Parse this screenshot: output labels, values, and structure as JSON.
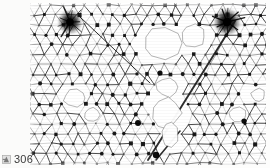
{
  "page": {
    "width": 270,
    "height": 168,
    "background_color": "#fdfdfc",
    "paper_color": "#ffffff"
  },
  "caption": {
    "page_number": "306",
    "glyph_name": "cropped-marginal-mark",
    "text_color": "#3a3a3a"
  },
  "figure": {
    "name": "triangular-lattice-micrograph",
    "panel": {
      "x": 30,
      "y": 3,
      "width": 236,
      "height": 162
    },
    "ink_color": "#111111",
    "mid_ink_color": "#555555",
    "faint_ink_color": "#9a9a9a",
    "void_color": "#ffffff"
  },
  "chart_data": {
    "type": "scatter",
    "title": "",
    "xlabel": "",
    "ylabel": "",
    "lattice": {
      "symmetry": "triangular",
      "spacing_x": 11.4,
      "spacing_y": 9.9,
      "row_offset": 5.7,
      "rows": 17,
      "cols": 22,
      "shear_per_row": 0.0,
      "jitter": 1.25,
      "seed": 20250306
    },
    "axis": {
      "xlim": [
        0,
        236
      ],
      "ylim": [
        0,
        162
      ],
      "grid": false,
      "legend": null
    },
    "voids": [
      {
        "name": "void-upper-center",
        "cx": 132,
        "cy": 40,
        "rx": 23,
        "ry": 19
      },
      {
        "name": "void-upper-right",
        "cx": 163,
        "cy": 34,
        "rx": 15,
        "ry": 13
      },
      {
        "name": "void-mid-center",
        "cx": 138,
        "cy": 84,
        "rx": 13,
        "ry": 11
      },
      {
        "name": "void-lower-center",
        "cx": 136,
        "cy": 110,
        "rx": 16,
        "ry": 16
      },
      {
        "name": "void-lower-center-2",
        "cx": 140,
        "cy": 132,
        "rx": 10,
        "ry": 13
      },
      {
        "name": "void-left-mid",
        "cx": 45,
        "cy": 95,
        "rx": 13,
        "ry": 10
      },
      {
        "name": "void-left-low",
        "cx": 62,
        "cy": 112,
        "rx": 9,
        "ry": 8
      },
      {
        "name": "void-right-low",
        "cx": 208,
        "cy": 112,
        "rx": 10,
        "ry": 9
      },
      {
        "name": "void-right-edge",
        "cx": 228,
        "cy": 92,
        "rx": 8,
        "ry": 7
      }
    ],
    "dark_clusters": [
      {
        "name": "cluster-top-left",
        "cx": 40,
        "cy": 19,
        "r": 9,
        "intensity": 0.95
      },
      {
        "name": "cluster-top-right",
        "cx": 197,
        "cy": 19,
        "r": 10,
        "intensity": 1.0
      }
    ],
    "dislocation_lines": [
      {
        "name": "dislocation-diagonal-main",
        "x1": 205,
        "y1": 18,
        "x2": 118,
        "y2": 157,
        "width": 1.9
      },
      {
        "name": "dislocation-diagonal-secondary",
        "x1": 126,
        "y1": 157,
        "x2": 150,
        "y2": 128,
        "width": 1.6
      },
      {
        "name": "grain-boundary-upper-left",
        "x1": 50,
        "y1": 14,
        "x2": 120,
        "y2": 80,
        "width": 1.0
      }
    ],
    "marked_nodes": [
      {
        "name": "node-dark-left-low",
        "cx": 108,
        "cy": 120,
        "r": 3.0
      },
      {
        "name": "node-dark-mid",
        "cx": 130,
        "cy": 70,
        "r": 2.6
      },
      {
        "name": "node-dark-right",
        "cx": 214,
        "cy": 118,
        "r": 2.6
      },
      {
        "name": "node-dark-bottom",
        "cx": 126,
        "cy": 152,
        "r": 3.2
      }
    ]
  }
}
